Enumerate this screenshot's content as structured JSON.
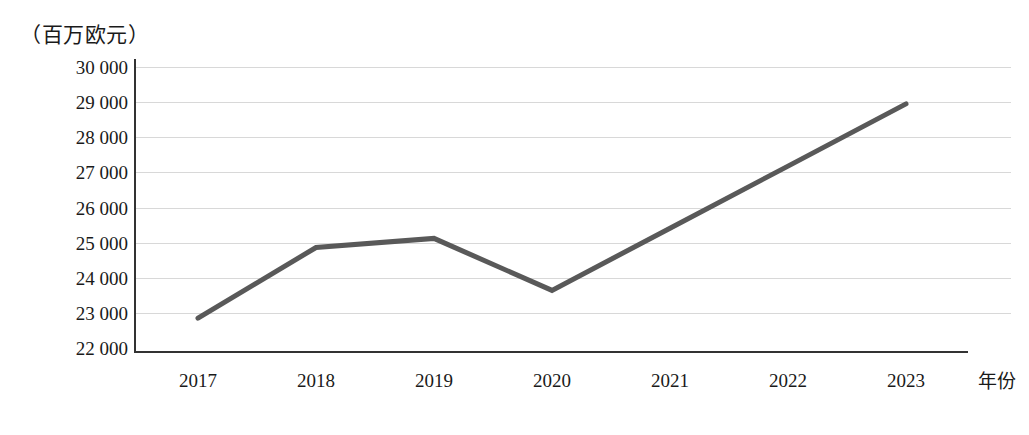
{
  "chart_data": {
    "type": "line",
    "title": "",
    "subtitle": "",
    "unit_caption": "（百万欧元）",
    "xlabel": "年份",
    "ylabel": "",
    "categories": [
      "2017",
      "2018",
      "2019",
      "2020",
      "2021",
      "2022",
      "2023"
    ],
    "values": [
      22850,
      24860,
      25120,
      23640,
      25410,
      27180,
      28950
    ],
    "series": [
      {
        "name": "",
        "color": "#595959",
        "values": [
          22850,
          24860,
          25120,
          23640,
          25410,
          27180,
          28950
        ]
      }
    ],
    "ylim": [
      22000,
      30000
    ],
    "ytick_step": 1000,
    "ytick_labels": [
      "30 000",
      "29 000",
      "28 000",
      "27 000",
      "26 000",
      "25 000",
      "24 000",
      "23 000",
      "22 000"
    ],
    "ytick_values": [
      30000,
      29000,
      28000,
      27000,
      26000,
      25000,
      24000,
      23000,
      22000
    ],
    "xtick_labels": [
      "2017",
      "2018",
      "2019",
      "2020",
      "2021",
      "2022",
      "2023"
    ],
    "grid": "horizontal",
    "legend": "none",
    "markers": "none",
    "line_width_px": 5,
    "annotations": []
  },
  "colors": {
    "series_line": "#595959",
    "axis": "#333333",
    "gridline": "#d8d8d8",
    "background": "#ffffff",
    "text": "#1a1a1a"
  }
}
